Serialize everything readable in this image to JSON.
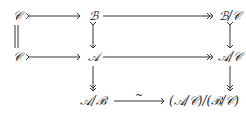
{
  "diagram": {
    "type": "commutative-diagram",
    "nodes": {
      "c_top": "𝒞",
      "b": "ℬ",
      "b_over_c": "ℬ/𝒞",
      "c_mid": "𝒞",
      "a": "𝒜",
      "a_over_c": "𝒜/𝒞",
      "a_over_b": "𝒜/ℬ",
      "quotient": "(𝒜/𝒞)/(ℬ/𝒞)"
    },
    "arrows": [
      {
        "from": "c_top",
        "to": "b",
        "kind": "monomorphism"
      },
      {
        "from": "b",
        "to": "b_over_c",
        "kind": "epimorphism"
      },
      {
        "from": "c_mid",
        "to": "a",
        "kind": "monomorphism"
      },
      {
        "from": "a",
        "to": "a_over_c",
        "kind": "epimorphism"
      },
      {
        "from": "c_top",
        "to": "c_mid",
        "kind": "equality"
      },
      {
        "from": "b",
        "to": "a",
        "kind": "monomorphism"
      },
      {
        "from": "b_over_c",
        "to": "a_over_c",
        "kind": "monomorphism"
      },
      {
        "from": "a",
        "to": "a_over_b",
        "kind": "epimorphism"
      },
      {
        "from": "a_over_c",
        "to": "quotient",
        "kind": "epimorphism"
      },
      {
        "from": "a_over_b",
        "to": "quotient",
        "kind": "isomorphism",
        "label": "~"
      }
    ],
    "iso_label": "~"
  }
}
